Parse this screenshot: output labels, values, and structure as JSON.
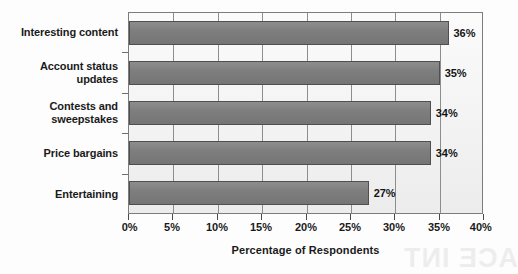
{
  "chart_data": {
    "type": "bar",
    "orientation": "horizontal",
    "title": "",
    "xlabel": "Percentage of Respondents",
    "ylabel": "",
    "xlim": [
      0,
      40
    ],
    "xtick_labels": [
      "0%",
      "5%",
      "10%",
      "15%",
      "20%",
      "25%",
      "30%",
      "35%",
      "40%"
    ],
    "xtick_values": [
      0,
      5,
      10,
      15,
      20,
      25,
      30,
      35,
      40
    ],
    "grid": true,
    "grid_axis": "x",
    "legend": false,
    "categories": [
      "Interesting content",
      "Account status\nupdates",
      "Contests and\nsweepstakes",
      "Price bargains",
      "Entertaining"
    ],
    "values": [
      36,
      35,
      34,
      34,
      27
    ],
    "data_labels": [
      "36%",
      "35%",
      "34%",
      "34%",
      "27%"
    ],
    "bars": [
      {
        "category": "Interesting content",
        "value": 36,
        "label": "36%"
      },
      {
        "category": "Account status updates",
        "value": 35,
        "label": "35%"
      },
      {
        "category": "Contests and sweepstakes",
        "value": 34,
        "label": "34%"
      },
      {
        "category": "Price bargains",
        "value": 34,
        "label": "34%"
      },
      {
        "category": "Entertaining",
        "value": 27,
        "label": "27%"
      }
    ],
    "colors": {
      "bar_fill": "#7e7e7e",
      "bar_border": "#4f4f4f",
      "plot_background": "#f4f4f4",
      "grid": "#8d8d8d",
      "axis": "#4a4a4a",
      "text": "#1a1a1a"
    }
  },
  "artifact": {
    "bleed_text": "ACE INT"
  }
}
